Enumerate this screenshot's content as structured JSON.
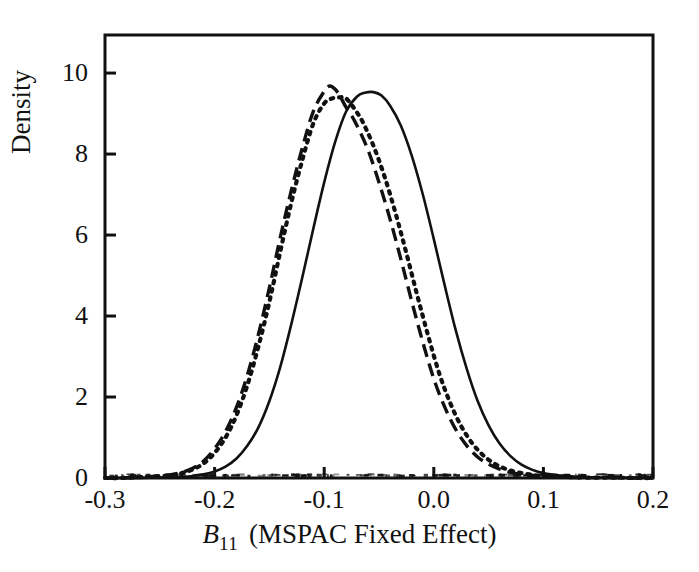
{
  "chart_data": {
    "type": "line",
    "title": "",
    "subtitle": "",
    "xlabel": "B_11 (MSPAC Fixed Effect)",
    "xlabel_parts": {
      "variable": "B",
      "subscript": "11",
      "rest": "(MSPAC Fixed Effect)"
    },
    "ylabel": "Density",
    "xlim": [
      -0.3,
      0.2
    ],
    "ylim": [
      0,
      10.94
    ],
    "xticks": [
      -0.3,
      -0.2,
      -0.1,
      0.0,
      0.1,
      0.2
    ],
    "xtick_labels": [
      "-0.3",
      "-0.2",
      "-0.1",
      "0.0",
      "0.1",
      "0.2"
    ],
    "yticks": [
      0,
      2,
      4,
      6,
      8,
      10
    ],
    "ytick_labels": [
      "0",
      "2",
      "4",
      "6",
      "8",
      "10"
    ],
    "grid": false,
    "legend": "none",
    "series": [
      {
        "name": "dashed-density",
        "style": "dashed",
        "color": "#111111",
        "peak_x": -0.095,
        "peak_y": 9.68,
        "x": [
          -0.3,
          -0.285,
          -0.27,
          -0.255,
          -0.24,
          -0.23,
          -0.22,
          -0.21,
          -0.2,
          -0.19,
          -0.18,
          -0.17,
          -0.16,
          -0.15,
          -0.14,
          -0.13,
          -0.12,
          -0.11,
          -0.1,
          -0.095,
          -0.09,
          -0.085,
          -0.08,
          -0.075,
          -0.07,
          -0.06,
          -0.05,
          -0.04,
          -0.03,
          -0.02,
          -0.01,
          0.0,
          0.01,
          0.02,
          0.03,
          0.04,
          0.05,
          0.06,
          0.07,
          0.08,
          0.09,
          0.1,
          0.12,
          0.14,
          0.16,
          0.18,
          0.2
        ],
        "y": [
          0.0,
          0.0,
          0.02,
          0.04,
          0.08,
          0.14,
          0.24,
          0.42,
          0.72,
          1.15,
          1.75,
          2.55,
          3.55,
          4.7,
          5.95,
          7.1,
          8.15,
          9.05,
          9.55,
          9.68,
          9.6,
          9.4,
          9.15,
          8.95,
          8.7,
          8.1,
          7.3,
          6.4,
          5.4,
          4.35,
          3.35,
          2.45,
          1.75,
          1.2,
          0.8,
          0.52,
          0.34,
          0.22,
          0.14,
          0.09,
          0.06,
          0.04,
          0.02,
          0.01,
          0.01,
          0.0,
          0.0
        ]
      },
      {
        "name": "dotted-density",
        "style": "dotted",
        "color": "#111111",
        "peak_x": -0.082,
        "peak_y": 9.4,
        "x": [
          -0.3,
          -0.285,
          -0.27,
          -0.255,
          -0.24,
          -0.23,
          -0.22,
          -0.21,
          -0.2,
          -0.19,
          -0.18,
          -0.17,
          -0.16,
          -0.15,
          -0.14,
          -0.13,
          -0.12,
          -0.11,
          -0.1,
          -0.092,
          -0.086,
          -0.082,
          -0.078,
          -0.072,
          -0.065,
          -0.055,
          -0.045,
          -0.035,
          -0.025,
          -0.015,
          -0.005,
          0.005,
          0.015,
          0.025,
          0.035,
          0.045,
          0.055,
          0.065,
          0.075,
          0.085,
          0.095,
          0.105,
          0.125,
          0.145,
          0.165,
          0.185,
          0.2
        ],
        "y": [
          0.0,
          0.0,
          0.02,
          0.04,
          0.07,
          0.12,
          0.21,
          0.36,
          0.62,
          1.0,
          1.55,
          2.3,
          3.25,
          4.35,
          5.6,
          6.8,
          7.85,
          8.75,
          9.25,
          9.38,
          9.4,
          9.4,
          9.32,
          9.1,
          8.8,
          8.2,
          7.45,
          6.55,
          5.55,
          4.5,
          3.5,
          2.58,
          1.85,
          1.28,
          0.86,
          0.56,
          0.36,
          0.23,
          0.15,
          0.1,
          0.06,
          0.04,
          0.02,
          0.01,
          0.01,
          0.0,
          0.0
        ]
      },
      {
        "name": "solid-density",
        "style": "solid",
        "color": "#111111",
        "peak_x": -0.055,
        "peak_y": 9.53,
        "x": [
          -0.3,
          -0.285,
          -0.27,
          -0.255,
          -0.24,
          -0.23,
          -0.22,
          -0.21,
          -0.2,
          -0.19,
          -0.18,
          -0.17,
          -0.16,
          -0.15,
          -0.14,
          -0.13,
          -0.12,
          -0.11,
          -0.1,
          -0.09,
          -0.08,
          -0.07,
          -0.062,
          -0.055,
          -0.048,
          -0.04,
          -0.03,
          -0.02,
          -0.01,
          0.0,
          0.01,
          0.02,
          0.03,
          0.04,
          0.05,
          0.06,
          0.07,
          0.08,
          0.09,
          0.1,
          0.115,
          0.13,
          0.15,
          0.17,
          0.185,
          0.195,
          0.2
        ],
        "y": [
          0.0,
          0.0,
          0.0,
          0.01,
          0.02,
          0.03,
          0.05,
          0.09,
          0.16,
          0.28,
          0.48,
          0.8,
          1.25,
          1.9,
          2.75,
          3.8,
          4.95,
          6.15,
          7.3,
          8.3,
          9.05,
          9.42,
          9.52,
          9.53,
          9.45,
          9.2,
          8.7,
          7.95,
          7.0,
          5.9,
          4.75,
          3.65,
          2.7,
          1.9,
          1.3,
          0.85,
          0.54,
          0.33,
          0.2,
          0.12,
          0.06,
          0.03,
          0.01,
          0.01,
          0.0,
          0.0,
          0.0
        ]
      }
    ],
    "baseline_noise": {
      "name": "baseline-speckle",
      "description": "fine speckled marks along the zero line"
    }
  },
  "axes": {
    "box_color": "#111111",
    "frame_left_px": 105,
    "frame_right_px": 653,
    "frame_top_px": 35,
    "frame_bottom_px": 478
  }
}
